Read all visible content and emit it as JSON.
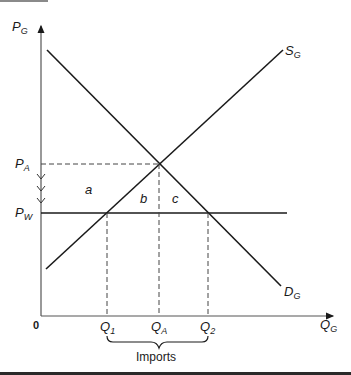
{
  "diagram": {
    "type": "supply-demand-import",
    "axes": {
      "y_label_main": "P",
      "y_label_sub": "G",
      "x_label_main": "Q",
      "x_label_sub": "G",
      "origin": "0"
    },
    "curves": {
      "supply": {
        "main": "S",
        "sub": "G"
      },
      "demand": {
        "main": "D",
        "sub": "G"
      }
    },
    "prices": {
      "autarky": {
        "main": "P",
        "sub": "A"
      },
      "world": {
        "main": "P",
        "sub": "W"
      }
    },
    "quantities": [
      {
        "main": "Q",
        "sub": "1"
      },
      {
        "main": "Q",
        "sub": "A"
      },
      {
        "main": "Q",
        "sub": "2"
      }
    ],
    "areas": [
      "a",
      "b",
      "c"
    ],
    "brace_label": "Imports"
  }
}
